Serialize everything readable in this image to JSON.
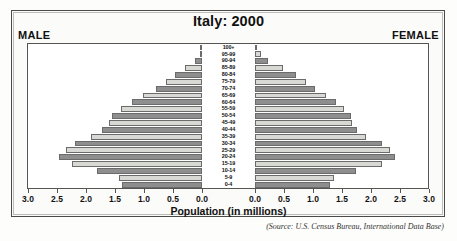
{
  "chart_title": "Italy: 2000",
  "male_label": "MALE",
  "female_label": "FEMALE",
  "axis_title": "Population (in millions)",
  "source": "(Source: U.S. Census Bureau, International Data Base)",
  "colors": {
    "bar_dark": "#8e8e8e",
    "bar_light": "#d8d8d4",
    "bar_border": "#6b6b6b",
    "frame": "#4a4a4a",
    "text": "#111111",
    "background": "#fdfdfb"
  },
  "chart_data": {
    "type": "bar",
    "subtype": "population-pyramid",
    "title": "Italy: 2000",
    "xlabel": "Population (in millions)",
    "ylabel": "",
    "xlim": [
      0,
      3.0
    ],
    "grid": false,
    "legend_position": "none",
    "axis_ticks_male": [
      "3.0",
      "2.5",
      "2.0",
      "1.5",
      "1.0",
      "0.5",
      "0.0"
    ],
    "axis_ticks_female": [
      "0.0",
      "0.5",
      "1.0",
      "1.5",
      "2.0",
      "2.5",
      "3.0"
    ],
    "tick_values": [
      0.0,
      0.5,
      1.0,
      1.5,
      2.0,
      2.5,
      3.0
    ],
    "categories": [
      "100+",
      "95-99",
      "90-94",
      "85-89",
      "80-84",
      "75-79",
      "70-74",
      "65-69",
      "60-64",
      "55-59",
      "50-54",
      "45-49",
      "40-44",
      "35-39",
      "30-34",
      "25-29",
      "20-24",
      "15-19",
      "10-14",
      "5-9",
      "0-4"
    ],
    "series": [
      {
        "name": "MALE",
        "side": "left",
        "values": [
          0.01,
          0.04,
          0.12,
          0.3,
          0.46,
          0.62,
          0.79,
          1.02,
          1.21,
          1.39,
          1.56,
          1.61,
          1.72,
          1.91,
          2.19,
          2.34,
          2.47,
          2.25,
          1.81,
          1.43,
          1.38
        ]
      },
      {
        "name": "FEMALE",
        "side": "right",
        "values": [
          0.02,
          0.1,
          0.22,
          0.48,
          0.7,
          0.88,
          1.03,
          1.22,
          1.39,
          1.53,
          1.65,
          1.67,
          1.76,
          1.92,
          2.19,
          2.32,
          2.41,
          2.19,
          1.74,
          1.37,
          1.3
        ]
      }
    ]
  }
}
